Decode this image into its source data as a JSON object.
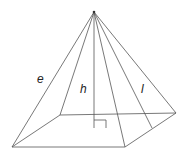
{
  "diagram": {
    "labels": {
      "edge": "e",
      "height": "h",
      "slant": "l"
    },
    "colors": {
      "line": "#555555",
      "text": "#222222",
      "background": "#ffffff"
    }
  }
}
